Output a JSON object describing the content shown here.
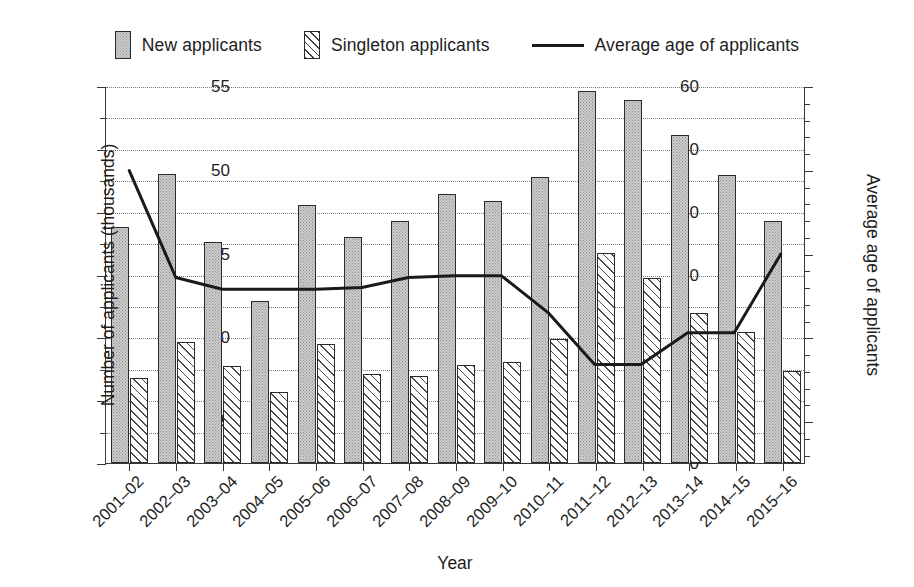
{
  "legend": {
    "items": [
      {
        "label": "New applicants",
        "marker": "bar-dotted-swatch"
      },
      {
        "label": "Singleton applicants",
        "marker": "bar-hatched-swatch"
      },
      {
        "label": "Average age of applicants",
        "marker": "line-swatch"
      }
    ]
  },
  "axes": {
    "x_title": "Year",
    "y_left_title": "Number of applicants (thousands)",
    "y_right_title": "Average age of applicants",
    "y_left_ticks": [
      "0",
      "10",
      "20",
      "30",
      "40",
      "50",
      "60"
    ],
    "y_right_ticks": [
      "35",
      "40",
      "45",
      "50",
      "55"
    ]
  },
  "chart_data": {
    "type": "bar",
    "title": "",
    "xlabel": "Year",
    "ylabel": "Number of applicants (thousands)",
    "y2label": "Average age of applicants",
    "ylim": [
      0,
      60
    ],
    "y2lim": [
      32.5,
      55
    ],
    "ytick_step": 10,
    "ytick_minor_step": 5,
    "y2tick_step": 5,
    "y2tick_minor_step": 1,
    "grid": true,
    "legend_position": "top",
    "categories": [
      "2001–02",
      "2002–03",
      "2003–04",
      "2004–05",
      "2005–06",
      "2006–07",
      "2007–08",
      "2008–09",
      "2009–10",
      "2010–11",
      "2011–12",
      "2012–13",
      "2013–14",
      "2014–15",
      "2015–16"
    ],
    "series": [
      {
        "name": "New applicants",
        "axis": "left",
        "kind": "bar",
        "values": [
          37.5,
          46.0,
          35.2,
          25.8,
          41.0,
          36.0,
          38.5,
          42.8,
          41.7,
          45.5,
          59.2,
          57.8,
          52.2,
          45.8,
          38.5
        ]
      },
      {
        "name": "Singleton applicants",
        "axis": "left",
        "kind": "bar",
        "values": [
          13.5,
          19.3,
          15.4,
          11.3,
          19.0,
          14.1,
          13.8,
          15.6,
          16.0,
          19.8,
          33.5,
          29.5,
          23.9,
          20.8,
          14.7
        ]
      },
      {
        "name": "Average age of applicants",
        "axis": "right",
        "kind": "line",
        "values": [
          50.0,
          43.6,
          42.9,
          42.9,
          42.9,
          43.0,
          43.6,
          43.7,
          43.7,
          41.5,
          38.4,
          38.4,
          40.3,
          40.3,
          45.0
        ]
      }
    ]
  }
}
